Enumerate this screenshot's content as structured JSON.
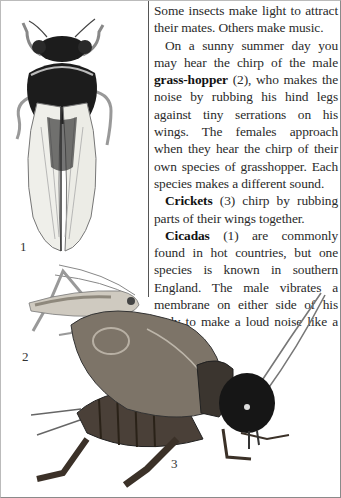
{
  "article": {
    "paragraphs": [
      {
        "parts": [
          {
            "text": "Some insects make light to attract their mates. Others make music.",
            "bold": false
          }
        ]
      },
      {
        "parts": [
          {
            "text": "On a sunny summer day you may hear the chirp of the male ",
            "bold": false
          },
          {
            "text": "grass-hopper",
            "bold": true
          },
          {
            "text": " (2), who makes the noise by rubbing his hind legs against tiny serrations on his wings. The females approach when they hear the chirp of their own species of grasshopper. Each species makes a different sound.",
            "bold": false
          }
        ]
      },
      {
        "parts": [
          {
            "text": "Crickets",
            "bold": true
          },
          {
            "text": " (3) chirp by rubbing parts of their wings together.",
            "bold": false
          }
        ]
      },
      {
        "parts": [
          {
            "text": "Cicadas",
            "bold": true
          },
          {
            "text": " (1) are commonly found in hot countries, but one species is known in southern England. The male vibrates a membrane on either side of his body to make a loud noise like a drum.",
            "bold": false
          }
        ]
      }
    ],
    "p1": "Some insects make light to attract their mates. Others make music.",
    "p2_a": "On a sunny summer day you may hear the chirp of the male ",
    "p2_b": "grass-hopper",
    "p2_c": " (2), who makes the noise by rubbing his hind legs against tiny serrations on his wings. The females approach when they hear the chirp of their own species of grasshopper. Each species makes a different sound.",
    "p3_a": "Crickets",
    "p3_b": " (3) chirp by rubbing parts of their wings together.",
    "p4_a": "Cicadas",
    "p4_b": " (1) are commonly found in hot countries, but one species is known in southern England. The male vibrates a membrane on either side of his body to make a loud noise like a drum."
  },
  "illustrations": [
    {
      "id": "cicada",
      "label": "1",
      "subject": "cicada"
    },
    {
      "id": "grasshopper",
      "label": "2",
      "subject": "grasshopper"
    },
    {
      "id": "cricket",
      "label": "3",
      "subject": "cricket"
    }
  ],
  "colors": {
    "text": "#2a2a2a",
    "cicada_body": "#1c1c1c",
    "wing": "#efefea",
    "grasshopper": "#cfcac0",
    "cricket_body": "#4a4038",
    "cricket_head": "#161616"
  }
}
